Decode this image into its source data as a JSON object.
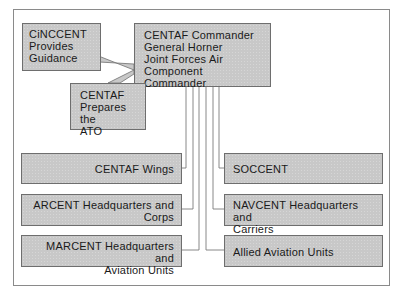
{
  "diagram": {
    "type": "organizational-flow",
    "nodes": {
      "cinccent": {
        "label": "CiNCCENT\nProvides\nGuidance"
      },
      "commander": {
        "label": "CENTAF Commander\nGeneral Horner\nJoint Forces Air\nComponent Commander"
      },
      "prepares": {
        "label": "CENTAF\nPrepares the\nATO"
      },
      "left_column": [
        {
          "label": "CENTAF Wings"
        },
        {
          "label": "ARCENT Headquarters and\nCorps"
        },
        {
          "label": "MARCENT Headquarters and\nAviation Units"
        }
      ],
      "right_column": [
        {
          "label": "SOCCENT"
        },
        {
          "label": "NAVCENT Headquarters and\nCarriers"
        },
        {
          "label": "Allied Aviation Units"
        }
      ]
    },
    "edges": [
      {
        "from": "cinccent",
        "to": "commander",
        "style": "callout"
      },
      {
        "from": "prepares",
        "to": "commander",
        "style": "callout"
      },
      {
        "from": "commander",
        "to": "CENTAF Wings"
      },
      {
        "from": "commander",
        "to": "ARCENT Headquarters and Corps"
      },
      {
        "from": "commander",
        "to": "MARCENT Headquarters and Aviation Units"
      },
      {
        "from": "commander",
        "to": "SOCCENT"
      },
      {
        "from": "commander",
        "to": "NAVCENT Headquarters and Carriers"
      },
      {
        "from": "commander",
        "to": "Allied Aviation Units"
      }
    ],
    "colors": {
      "box_fill": "#c8c8c8",
      "box_border": "#6e6e6e",
      "line": "#7a7a7a",
      "frame": "#8a8a8a"
    }
  }
}
